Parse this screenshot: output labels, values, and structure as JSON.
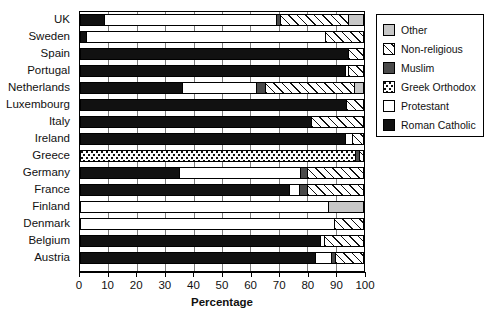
{
  "chart_data": {
    "type": "bar",
    "orientation": "horizontal",
    "stacked": true,
    "title": "",
    "xlabel": "Percentage",
    "ylabel": "",
    "xlim": [
      0,
      100
    ],
    "xticks": [
      0,
      10,
      20,
      30,
      40,
      50,
      60,
      70,
      80,
      90,
      100
    ],
    "grid": true,
    "legend_position": "right-outside",
    "categories": [
      "UK",
      "Sweden",
      "Spain",
      "Portugal",
      "Netherlands",
      "Luxembourg",
      "Italy",
      "Ireland",
      "Greece",
      "Germany",
      "France",
      "Finland",
      "Denmark",
      "Belgium",
      "Austria"
    ],
    "series": [
      {
        "name": "Roman Catholic",
        "key": "roman-catholic",
        "color": "#111111",
        "pattern": "solid-black",
        "values": [
          8.6,
          2.0,
          95.0,
          94.0,
          36.0,
          94.5,
          82.0,
          94.0,
          0.0,
          35.0,
          74.0,
          0.0,
          0.0,
          85.0,
          83.5
        ]
      },
      {
        "name": "Protestant",
        "key": "protestant",
        "color": "#ffffff",
        "pattern": "solid-white",
        "values": [
          61.0,
          85.0,
          0.0,
          1.0,
          26.5,
          0.0,
          0.0,
          2.5,
          0.0,
          43.0,
          3.5,
          88.0,
          90.0,
          1.5,
          5.5
        ]
      },
      {
        "name": "Greek Orthodox",
        "key": "greek-orthodox",
        "color": "#ffffff",
        "pattern": "dotted",
        "values": [
          0.0,
          0.0,
          0.0,
          0.0,
          0.0,
          0.0,
          0.0,
          0.0,
          97.5,
          0.0,
          0.0,
          0.0,
          0.0,
          0.0,
          0.0
        ]
      },
      {
        "name": "Muslim",
        "key": "muslim",
        "color": "#4a4a4a",
        "pattern": "solid-gray",
        "values": [
          1.4,
          0.0,
          0.0,
          0.0,
          3.0,
          0.0,
          0.0,
          0.0,
          1.5,
          2.5,
          3.0,
          0.0,
          0.0,
          0.0,
          1.5
        ]
      },
      {
        "name": "Non-religious",
        "key": "non-religious",
        "color": "#ffffff",
        "pattern": "diagonal-hatch",
        "values": [
          24.0,
          13.0,
          5.0,
          5.0,
          31.5,
          5.5,
          18.0,
          3.5,
          1.0,
          19.5,
          19.5,
          0.0,
          10.0,
          13.5,
          9.5
        ]
      },
      {
        "name": "Other",
        "key": "other",
        "color": "#c7c7c7",
        "pattern": "solid-lightgray",
        "values": [
          5.0,
          0.0,
          0.0,
          0.0,
          3.0,
          0.0,
          0.0,
          0.0,
          0.0,
          0.0,
          0.0,
          12.0,
          0.0,
          0.0,
          0.0
        ]
      }
    ]
  },
  "legend": {
    "items": [
      {
        "label": "Other",
        "key": "other"
      },
      {
        "label": "Non-religious",
        "key": "non-religious"
      },
      {
        "label": "Muslim",
        "key": "muslim"
      },
      {
        "label": "Greek Orthodox",
        "key": "greek-orthodox"
      },
      {
        "label": "Protestant",
        "key": "protestant"
      },
      {
        "label": "Roman Catholic",
        "key": "roman-catholic"
      }
    ]
  }
}
